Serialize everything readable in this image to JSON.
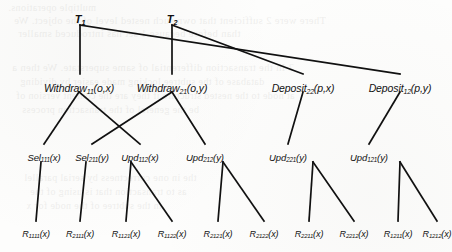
{
  "figure": {
    "background_color": "#fdfdfc",
    "line_color": "#111111"
  },
  "nodes": {
    "transactions": [
      {
        "id": "T1",
        "base": "T",
        "sub": "1",
        "args": "",
        "x": 80,
        "y": 14
      },
      {
        "id": "T2",
        "base": "T",
        "sub": "2",
        "args": "",
        "x": 172,
        "y": 14
      }
    ],
    "operations": [
      {
        "id": "W11",
        "base": "Withdraw",
        "sub": "11",
        "args": "(o,x)",
        "x": 79,
        "y": 83
      },
      {
        "id": "W21",
        "base": "Withdraw",
        "sub": "21",
        "args": "(o,y)",
        "x": 172,
        "y": 83
      },
      {
        "id": "D22",
        "base": "Deposit",
        "sub": "22",
        "args": "(p,x)",
        "x": 303,
        "y": 83
      },
      {
        "id": "D12",
        "base": "Deposit",
        "sub": "12",
        "args": "(p,y)",
        "x": 400,
        "y": 83
      }
    ],
    "subops": [
      {
        "id": "Sel111",
        "base": "Sel",
        "sub": "111",
        "args": "(x)",
        "x": 44,
        "y": 153
      },
      {
        "id": "Sel211",
        "base": "Sel",
        "sub": "211",
        "args": "(y)",
        "x": 92,
        "y": 153
      },
      {
        "id": "Upd112",
        "base": "Upd",
        "sub": "112",
        "args": "(x)",
        "x": 140,
        "y": 153
      },
      {
        "id": "Upd212",
        "base": "Upd",
        "sub": "212",
        "args": "(y)",
        "x": 205,
        "y": 153
      },
      {
        "id": "Upd221",
        "base": "Upd",
        "sub": "221",
        "args": "(y)",
        "x": 288,
        "y": 153
      },
      {
        "id": "Upd121",
        "base": "Upd",
        "sub": "121",
        "args": "(y)",
        "x": 369,
        "y": 153
      }
    ],
    "leaves": [
      {
        "id": "R1111",
        "base": "R",
        "sub": "1111",
        "args": "(x)",
        "x": 36,
        "y": 230
      },
      {
        "id": "R2111",
        "base": "R",
        "sub": "2111",
        "args": "(x)",
        "x": 80,
        "y": 230
      },
      {
        "id": "R1121",
        "base": "R",
        "sub": "1121",
        "args": "(x)",
        "x": 126,
        "y": 230
      },
      {
        "id": "R1122",
        "base": "R",
        "sub": "1122",
        "args": "(x)",
        "x": 172,
        "y": 230
      },
      {
        "id": "R2121",
        "base": "R",
        "sub": "2121",
        "args": "(x)",
        "x": 218,
        "y": 230
      },
      {
        "id": "R2122",
        "base": "R",
        "sub": "2122",
        "args": "(x)",
        "x": 264,
        "y": 230
      },
      {
        "id": "R2211",
        "base": "R",
        "sub": "2211",
        "args": "(x)",
        "x": 309,
        "y": 230
      },
      {
        "id": "R2212",
        "base": "R",
        "sub": "2212",
        "args": "(x)",
        "x": 354,
        "y": 230
      },
      {
        "id": "R1211",
        "base": "R",
        "sub": "1211",
        "args": "(x)",
        "x": 398,
        "y": 230
      },
      {
        "id": "R1212",
        "base": "R",
        "sub": "1212",
        "args": "(x)",
        "x": 437,
        "y": 230
      }
    ]
  },
  "edges": [
    {
      "from": "T1",
      "to": "W11",
      "x1": 80,
      "y1": 25,
      "x2": 80,
      "y2": 74
    },
    {
      "from": "T1",
      "to": "D12",
      "x1": 80,
      "y1": 25,
      "x2": 400,
      "y2": 74
    },
    {
      "from": "T2",
      "to": "W21",
      "x1": 172,
      "y1": 25,
      "x2": 172,
      "y2": 74
    },
    {
      "from": "T2",
      "to": "D22",
      "x1": 172,
      "y1": 25,
      "x2": 303,
      "y2": 74
    },
    {
      "from": "W11",
      "to": "Sel111",
      "x1": 79,
      "y1": 92,
      "x2": 44,
      "y2": 144
    },
    {
      "from": "W11",
      "to": "Upd112",
      "x1": 79,
      "y1": 92,
      "x2": 140,
      "y2": 144
    },
    {
      "from": "W21",
      "to": "Sel211",
      "x1": 172,
      "y1": 92,
      "x2": 92,
      "y2": 144
    },
    {
      "from": "W21",
      "to": "Upd212",
      "x1": 172,
      "y1": 92,
      "x2": 205,
      "y2": 144
    },
    {
      "from": "D22",
      "to": "Upd221",
      "x1": 303,
      "y1": 92,
      "x2": 288,
      "y2": 144
    },
    {
      "from": "D12",
      "to": "Upd121",
      "x1": 400,
      "y1": 92,
      "x2": 369,
      "y2": 144
    },
    {
      "from": "Sel111",
      "to": "R1111",
      "x1": 41,
      "y1": 162,
      "x2": 36,
      "y2": 221
    },
    {
      "from": "Sel211",
      "to": "R2111",
      "x1": 86,
      "y1": 162,
      "x2": 80,
      "y2": 221
    },
    {
      "from": "Upd112",
      "to": "R1121",
      "x1": 131,
      "y1": 162,
      "x2": 126,
      "y2": 221
    },
    {
      "from": "Upd112",
      "to": "R1122",
      "x1": 131,
      "y1": 162,
      "x2": 172,
      "y2": 221
    },
    {
      "from": "Upd212",
      "to": "R2121",
      "x1": 223,
      "y1": 162,
      "x2": 218,
      "y2": 221
    },
    {
      "from": "Upd212",
      "to": "R2122",
      "x1": 223,
      "y1": 162,
      "x2": 264,
      "y2": 221
    },
    {
      "from": "Upd221",
      "to": "R2211",
      "x1": 313,
      "y1": 162,
      "x2": 309,
      "y2": 221
    },
    {
      "from": "Upd221",
      "to": "R2212",
      "x1": 313,
      "y1": 162,
      "x2": 354,
      "y2": 221
    },
    {
      "from": "Upd121",
      "to": "R1211",
      "x1": 400,
      "y1": 162,
      "x2": 398,
      "y2": 221
    },
    {
      "from": "Upd121",
      "to": "R1212",
      "x1": 400,
      "y1": 162,
      "x2": 437,
      "y2": 221
    }
  ],
  "background_bleed": [
    {
      "text": "multiple operations.",
      "x": 8,
      "y": 2,
      "size": 10
    },
    {
      "text": "There were 2 sufficient  that own  such nested  level of the object. We",
      "x": 14,
      "y": 15,
      "size": 10.5
    },
    {
      "text": "than before because 1 set has introduced smaller",
      "x": 18,
      "y": 28,
      "size": 10.5
    },
    {
      "text": "2  In the  transaction  differential  of same  superstate.  We then a",
      "x": 12,
      "y": 62,
      "size": 10.5
    },
    {
      "text": "database  of the  subtree locking  made  easier by  dividing",
      "x": 20,
      "y": 76,
      "size": 10
    },
    {
      "text": "at node  to  the  nested  structure  if they  are  the  content  version  of",
      "x": 16,
      "y": 90,
      "size": 10
    },
    {
      "text": "be  the  general  of  the  transaction  process",
      "x": 22,
      "y": 104,
      "size": 10
    },
    {
      "text": "the  in  one  correctness  by  serial  parallel",
      "x": 24,
      "y": 172,
      "size": 10
    },
    {
      "text": "as  to  transaction  that  is  using  of  the",
      "x": 30,
      "y": 186,
      "size": 10
    },
    {
      "text": "in  the  subtree  of  the  node  for  x",
      "x": 26,
      "y": 200,
      "size": 10
    }
  ]
}
